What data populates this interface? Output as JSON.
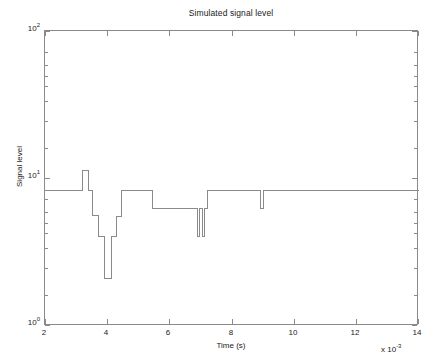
{
  "figure": {
    "width": 435,
    "height": 361,
    "background": "#ffffff",
    "line_color": "#8a8a8a",
    "axis_color": "#8a8a8a",
    "text_color": "#1a1a1a"
  },
  "axis_labels": {
    "x_title": "Time (s)",
    "y_title": "Signal level",
    "x_multiplier_prefix": "x 10",
    "x_multiplier_exponent": "-3",
    "y_tick_mantissa": "10",
    "y_ticks": [
      {
        "label_base": "10",
        "label_exp": "0",
        "value": 1
      },
      {
        "label_base": "10",
        "label_exp": "1",
        "value": 10
      },
      {
        "label_base": "10",
        "label_exp": "2",
        "value": 100
      }
    ],
    "x_ticks": [
      "2",
      "4",
      "6",
      "8",
      "10",
      "12",
      "14"
    ]
  },
  "chart_data": {
    "type": "line",
    "subtype": "step-post",
    "title": "Simulated signal level",
    "xlabel": "Time (s)",
    "ylabel": "Signal level",
    "x_scale": "linear",
    "y_scale": "log",
    "x_multiplier": 0.001,
    "xlim": [
      2,
      14
    ],
    "ylim": [
      1,
      100
    ],
    "grid": false,
    "legend": null,
    "x_unit": "ms",
    "series": [
      {
        "name": "Simulated signal level",
        "color": "#8a8a8a",
        "x": [
          2.0,
          3.2,
          3.2,
          3.38,
          3.38,
          3.52,
          3.52,
          3.72,
          3.72,
          3.9,
          3.9,
          4.12,
          4.12,
          4.3,
          4.3,
          4.45,
          4.45,
          5.45,
          5.45,
          6.9,
          6.9,
          6.97,
          6.97,
          7.05,
          7.05,
          7.12,
          7.12,
          7.2,
          7.2,
          8.92,
          8.92,
          9.02,
          9.02,
          14.0
        ],
        "y": [
          8.3,
          8.3,
          11.4,
          11.4,
          8.3,
          8.3,
          5.6,
          5.6,
          4.05,
          4.05,
          2.1,
          2.1,
          4.05,
          4.05,
          5.55,
          5.55,
          8.3,
          8.3,
          6.3,
          6.3,
          4.05,
          4.05,
          6.3,
          6.3,
          4.05,
          4.05,
          6.3,
          6.3,
          8.3,
          8.3,
          6.3,
          6.3,
          8.3,
          8.3
        ],
        "plateau_levels": {
          "baseline": 8.3,
          "peak": 11.4,
          "mid_high": 6.3,
          "mid": 5.6,
          "low": 4.05,
          "deep_min": 2.1
        }
      }
    ],
    "annotations": [
      {
        "text": "narrow dip cluster",
        "x_range": [
          6.9,
          7.2
        ],
        "y": 4.05
      },
      {
        "text": "isolated narrow dip",
        "x_range": [
          8.92,
          9.02
        ],
        "y": 6.3
      },
      {
        "text": "deepest excursion",
        "x_range": [
          3.9,
          4.12
        ],
        "y": 2.1
      }
    ]
  }
}
